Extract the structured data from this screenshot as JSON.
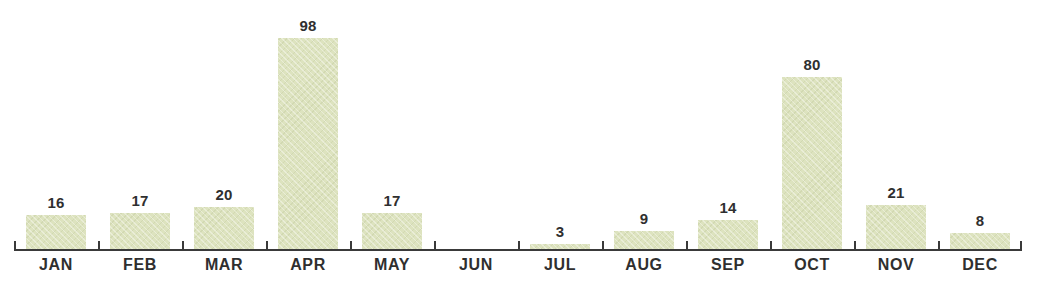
{
  "chart_data": {
    "type": "bar",
    "title": "",
    "subtitle": "",
    "xlabel": "",
    "ylabel": "",
    "categories": [
      "JAN",
      "FEB",
      "MAR",
      "APR",
      "MAY",
      "JUN",
      "JUL",
      "AUG",
      "SEP",
      "OCT",
      "NOV",
      "DEC"
    ],
    "values": [
      16,
      17,
      20,
      98,
      17,
      0,
      3,
      9,
      14,
      80,
      21,
      8
    ],
    "value_labels": [
      "16",
      "17",
      "20",
      "98",
      "17",
      "",
      "3",
      "9",
      "14",
      "80",
      "21",
      "8"
    ],
    "ylim": [
      0,
      98
    ],
    "grid": false,
    "legend": false,
    "bar_color": "#dde3bf",
    "axis_color": "#3a3a3a",
    "label_color": "#2f2f2f",
    "background": "#ffffff"
  }
}
